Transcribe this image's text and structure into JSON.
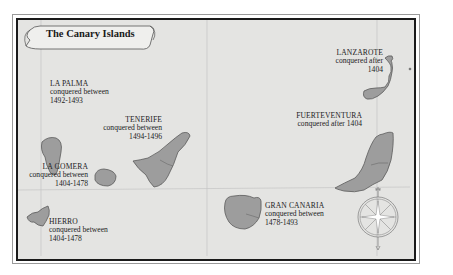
{
  "map": {
    "title": "The Canary Islands",
    "islands": [
      {
        "id": "la-palma",
        "name": "LA PALMA",
        "line1": "conquered between",
        "line2": "1492-1493"
      },
      {
        "id": "tenerife",
        "name": "TENERIFE",
        "line1": "conquered between",
        "line2": "1494-1496"
      },
      {
        "id": "la-gomera",
        "name": "LA GOMERA",
        "line1": "conquered between",
        "line2": "1404-1478"
      },
      {
        "id": "hierro",
        "name": "HIERRO",
        "line1": "conquered between",
        "line2": "1404-1478"
      },
      {
        "id": "gran-canaria",
        "name": "GRAN CANARIA",
        "line1": "conquered between",
        "line2": "1478-1493"
      },
      {
        "id": "fuerteventura",
        "name": "FUERTEVENTURA",
        "line1": "conquered after 1404",
        "line2": ""
      },
      {
        "id": "lanzarote",
        "name": "LANZAROTE",
        "line1": "conquered after",
        "line2": "1404"
      }
    ],
    "compass": "compass-rose",
    "colors": {
      "sea": "#e4e4e2",
      "land": "#9b9b9b",
      "land_stroke": "#5a5a5a",
      "frame": "#1a1a1a",
      "grid": "#c2c2c2"
    }
  }
}
